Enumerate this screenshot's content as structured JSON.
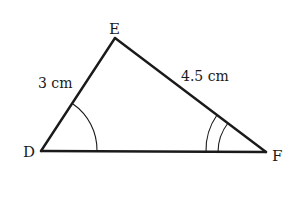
{
  "diagram": {
    "type": "triangle",
    "vertices": {
      "D": {
        "label": "D",
        "x": 41,
        "y": 151
      },
      "E": {
        "label": "E",
        "x": 115,
        "y": 38
      },
      "F": {
        "label": "F",
        "x": 266,
        "y": 152
      }
    },
    "sides": {
      "DE": {
        "label": "3 cm"
      },
      "EF": {
        "label": "4.5 cm"
      },
      "DF": {
        "label": ""
      }
    },
    "angle_marks": {
      "D": {
        "arcs": 1
      },
      "F": {
        "arcs": 2
      }
    },
    "colors": {
      "stroke": "#1a1a1a",
      "background": "#ffffff"
    }
  }
}
